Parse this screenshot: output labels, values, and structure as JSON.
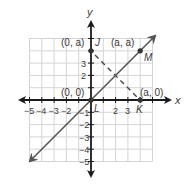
{
  "diagram": {
    "type": "coordinate-plane",
    "axes": {
      "x_label": "x",
      "y_label": "y",
      "x_ticks": [
        "−5",
        "−4",
        "−3",
        "−2",
        "2",
        "3"
      ],
      "y_ticks": [
        "3",
        "2",
        "−1",
        "−2",
        "−3",
        "−4",
        "−5"
      ],
      "range": [
        -5,
        5
      ]
    },
    "points": [
      {
        "name": "J",
        "coord_label": "(0, a)"
      },
      {
        "name": "M",
        "coord_label": "(a, a)"
      },
      {
        "name": "K",
        "coord_label": "(a, 0)"
      },
      {
        "name": "L",
        "coord_label": "(0, 0)"
      }
    ],
    "lines": [
      {
        "name": "line-LM",
        "style": "solid",
        "description": "line through L and M with arrows at both ends"
      },
      {
        "name": "segment-JK",
        "style": "dashed"
      }
    ],
    "colors": {
      "grid": "#d4d4d4",
      "axis": "#1a1a1a",
      "line": "#555555",
      "point": "#333333"
    }
  }
}
